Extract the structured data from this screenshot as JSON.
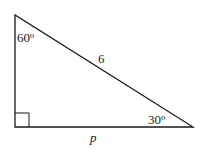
{
  "diagram": {
    "type": "right-triangle",
    "vertices": {
      "top": [
        15,
        15
      ],
      "bottom_left": [
        15,
        127
      ],
      "bottom_right": [
        193,
        127
      ]
    },
    "right_angle_marker": {
      "x": 15,
      "y": 113,
      "size": 14
    },
    "labels": {
      "top_angle": "60º",
      "hypotenuse": "6",
      "bottom_right_angle": "30º",
      "base": "p"
    },
    "stroke_color": "#1a1a1a",
    "background": "#ffffff"
  }
}
